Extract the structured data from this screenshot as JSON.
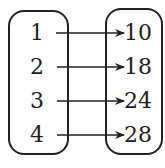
{
  "diagram": {
    "type": "mapping",
    "domain": [
      "1",
      "2",
      "3",
      "4"
    ],
    "range": [
      "10",
      "18",
      "24",
      "28"
    ],
    "arrows": [
      {
        "from": "1",
        "to": "10"
      },
      {
        "from": "2",
        "to": "18"
      },
      {
        "from": "3",
        "to": "24"
      },
      {
        "from": "4",
        "to": "28"
      }
    ]
  }
}
